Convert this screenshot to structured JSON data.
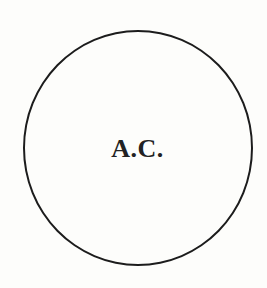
{
  "diagram": {
    "shape": "circle",
    "label": "A.C.",
    "stroke_color": "#1c1c1c",
    "text_color": "#222222",
    "background_color": "#fdfdfb"
  }
}
